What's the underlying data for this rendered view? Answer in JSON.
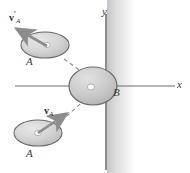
{
  "figure": {
    "background_color": "#ffffff",
    "width": 190,
    "height": 173
  },
  "axes": {
    "x_label": "x",
    "y_label": "y",
    "axis_color": "#6f6f6f",
    "x_axis": {
      "x1": 15,
      "y1": 86,
      "x2": 175,
      "y2": 86
    },
    "y_axis": {
      "x1": 106,
      "y1": 14,
      "x2": 106,
      "y2": 170
    },
    "x_label_pos": {
      "left": 177,
      "top": 80
    },
    "y_label_pos": {
      "left": 102,
      "top": 7
    }
  },
  "wall": {
    "name": "shaded-band",
    "color": "#d9d9d9",
    "x": 107,
    "width": 28
  },
  "bodies": [
    {
      "id": "puck-A-after",
      "label": "A",
      "cx": 45,
      "cy": 45,
      "rx": 24,
      "ry": 13,
      "fill": "#d2d2d2",
      "stroke": "#6a6a6a",
      "label_pos": {
        "left": 26,
        "top": 57
      }
    },
    {
      "id": "puck-B",
      "label": "B",
      "cx": 93,
      "cy": 86,
      "rx": 24,
      "ry": 19,
      "fill": "#c9c9c9",
      "stroke": "#6a6a6a",
      "label_pos": {
        "left": 113,
        "top": 88
      }
    },
    {
      "id": "puck-A-before",
      "label": "A",
      "cx": 38,
      "cy": 133,
      "rx": 24,
      "ry": 13,
      "fill": "#d2d2d2",
      "stroke": "#6a6a6a",
      "label_pos": {
        "left": 26,
        "top": 148
      }
    }
  ],
  "vectors": [
    {
      "id": "velocity-A-after",
      "symbol": "v",
      "subscript": "A",
      "prime": "′",
      "from": {
        "x": 45,
        "y": 45
      },
      "to": {
        "x": 14,
        "y": 27
      },
      "color": "#8d8d8d",
      "label_pos": {
        "left": 10,
        "top": 9
      }
    },
    {
      "id": "velocity-A-before",
      "symbol": "v",
      "subscript": "A",
      "prime": "",
      "from": {
        "x": 38,
        "y": 133
      },
      "to": {
        "x": 69,
        "y": 112
      },
      "color": "#8d8d8d",
      "label_pos": {
        "left": 44,
        "top": 105
      }
    }
  ],
  "paths": [
    {
      "id": "incoming-path",
      "from": {
        "x": 62,
        "y": 120
      },
      "to": {
        "x": 86,
        "y": 98
      },
      "style": "dashed",
      "color": "#8a8a8a"
    },
    {
      "id": "outgoing-path",
      "from": {
        "x": 64,
        "y": 60
      },
      "to": {
        "x": 88,
        "y": 77
      },
      "style": "dashed",
      "color": "#8a8a8a"
    }
  ],
  "centers": {
    "marker_color": "#ffffff",
    "marker_stroke": "#8a8a8a"
  }
}
